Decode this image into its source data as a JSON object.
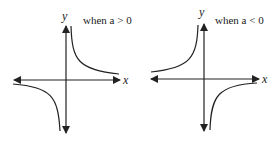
{
  "graphs": [
    {
      "condition": "when a > 0",
      "x_label": "x",
      "y_label": "y",
      "sign": 1
    },
    {
      "condition": "when a < 0",
      "x_label": "x",
      "y_label": "y",
      "sign": -1
    }
  ],
  "colors": {
    "stroke": "#222222"
  }
}
